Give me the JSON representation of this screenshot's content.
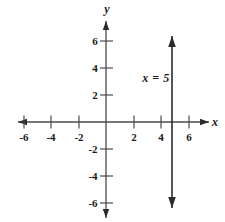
{
  "figure": {
    "type": "cartesian-graph",
    "background_color": "#ffffff",
    "stroke_color": "#2b2b2b",
    "axes": {
      "x": {
        "name": "x",
        "name_pos": [
          215,
          122
        ],
        "arrow_left": true,
        "arrow_right": true,
        "line": [
          18,
          122,
          209,
          122
        ],
        "ticks": [
          {
            "label": "-6",
            "value": -6,
            "x": 24,
            "label_pos": [
              24,
              137
            ]
          },
          {
            "label": "-4",
            "value": -4,
            "x": 51,
            "label_pos": [
              51,
              137
            ]
          },
          {
            "label": "-2",
            "value": -2,
            "x": 79,
            "label_pos": [
              79,
              137
            ]
          },
          {
            "label": "2",
            "value": 2,
            "x": 134,
            "label_pos": [
              134,
              137
            ]
          },
          {
            "label": "4",
            "value": 4,
            "x": 161,
            "label_pos": [
              161,
              137
            ]
          },
          {
            "label": "6",
            "value": 6,
            "x": 189,
            "label_pos": [
              189,
              137
            ]
          }
        ]
      },
      "y": {
        "name": "y",
        "name_pos": [
          107,
          9
        ],
        "arrow_up": true,
        "arrow_down": true,
        "line": [
          106,
          21,
          106,
          218
        ],
        "ticks": [
          {
            "label": "6",
            "value": 6,
            "y": 41,
            "label_pos": [
              95,
              41
            ]
          },
          {
            "label": "4",
            "value": 4,
            "y": 68,
            "label_pos": [
              95,
              68
            ]
          },
          {
            "label": "2",
            "value": 2,
            "y": 95,
            "label_pos": [
              95,
              95
            ]
          },
          {
            "label": "-2",
            "value": -2,
            "y": 149,
            "label_pos": [
              93,
              149
            ]
          },
          {
            "label": "-4",
            "value": -4,
            "y": 176,
            "label_pos": [
              93,
              176
            ]
          },
          {
            "label": "-6",
            "value": -6,
            "y": 203,
            "label_pos": [
              93,
              203
            ]
          }
        ]
      }
    },
    "origin": [
      106,
      122
    ],
    "unit_px": 13.7,
    "graphed_line": {
      "equation": "x = 5",
      "orientation": "vertical",
      "x_value": 5,
      "pixel_x": 172,
      "top": 36,
      "bottom": 208,
      "arrow_top": true,
      "arrow_bottom": true,
      "label": "x = 5",
      "label_pos": [
        156,
        78
      ]
    }
  }
}
